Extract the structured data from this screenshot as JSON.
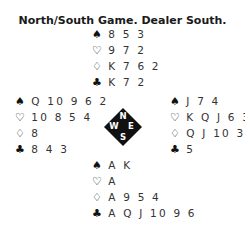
{
  "title": "North/South Game. Dealer South.",
  "hands": {
    "north": {
      "spades": "8 5 3",
      "hearts": "9 7 2",
      "diamonds": "K 7 6 2",
      "clubs": "K 7 2"
    },
    "west": {
      "spades": "Q 10 9 6 2",
      "hearts": "10 8 5 4",
      "diamonds": "8",
      "clubs": "8 4 3"
    },
    "east": {
      "spades": "J 7 4",
      "hearts": "K Q J 6 3",
      "diamonds": "Q J 10 3",
      "clubs": "5"
    },
    "south": {
      "spades": "A K",
      "hearts": "A",
      "diamonds": "A 9 5 4",
      "clubs": "A Q J 10 9 6"
    }
  },
  "suit_symbols": {
    "spades": "♠",
    "hearts": "♡",
    "diamonds": "♢",
    "clubs": "♣"
  },
  "compass": {
    "n": "N",
    "e": "E",
    "s": "S",
    "w": "W"
  }
}
